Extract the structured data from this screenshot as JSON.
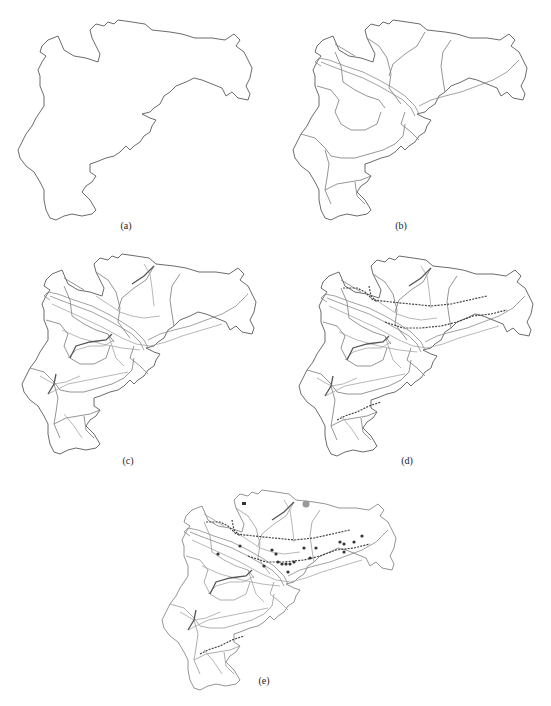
{
  "figure": {
    "panels": [
      {
        "id": "a",
        "caption": "(a)",
        "layers": [
          "boundary"
        ]
      },
      {
        "id": "b",
        "caption": "(b)",
        "layers": [
          "boundary",
          "districts",
          "river"
        ]
      },
      {
        "id": "c",
        "caption": "(c)",
        "layers": [
          "boundary",
          "districts",
          "river",
          "roads"
        ]
      },
      {
        "id": "d",
        "caption": "(d)",
        "layers": [
          "boundary",
          "districts",
          "river",
          "roads",
          "railways"
        ]
      },
      {
        "id": "e",
        "caption": "(e)",
        "layers": [
          "boundary",
          "districts",
          "river",
          "roads",
          "railways",
          "point-features"
        ]
      }
    ]
  },
  "colors": {
    "outline": "#5a5a5a",
    "district": "#7a7a7a",
    "road": "#9a9a9a",
    "rail": "#444444",
    "point": "#333333",
    "highlight": "#999999"
  }
}
